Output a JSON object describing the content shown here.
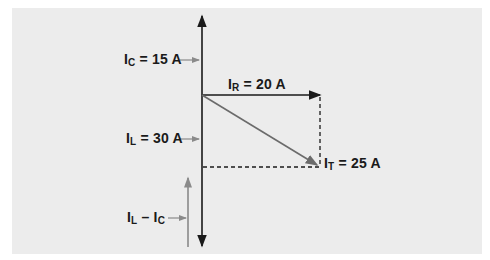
{
  "diagram": {
    "colors": {
      "background": "#ececec",
      "axis": "#1a1a1a",
      "resultant": "#6b6b6b",
      "pointer": "#8a8a8a",
      "dashed": "#1a1a1a"
    },
    "labels": {
      "ic": {
        "main": "I",
        "sub": "C",
        "value": "= 15 A"
      },
      "ir": {
        "main": "I",
        "sub": "R",
        "value": "= 20 A"
      },
      "il": {
        "main": "I",
        "sub": "L",
        "value": "= 30 A"
      },
      "it": {
        "main": "I",
        "sub": "T",
        "value": "= 25 A"
      },
      "diff": {
        "main1": "I",
        "sub1": "L",
        "minus": " – ",
        "main2": "I",
        "sub2": "C"
      }
    }
  }
}
